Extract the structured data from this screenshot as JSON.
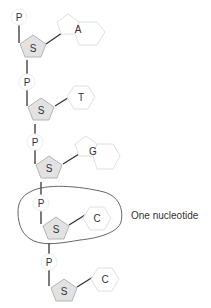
{
  "diagram": {
    "phosphate_label": "P",
    "sugar_label": "S",
    "nucleotides": [
      {
        "phosphate": "P",
        "sugar": "S",
        "base": "A",
        "base_type": "purine"
      },
      {
        "phosphate": "P",
        "sugar": "S",
        "base": "T",
        "base_type": "pyrimidine"
      },
      {
        "phosphate": "P",
        "sugar": "S",
        "base": "G",
        "base_type": "purine"
      },
      {
        "phosphate": "P",
        "sugar": "S",
        "base": "C",
        "base_type": "pyrimidine"
      },
      {
        "phosphate": "P",
        "sugar": "S",
        "base": "C",
        "base_type": "pyrimidine"
      }
    ],
    "annotation": "One nucleotide",
    "colors": {
      "sugar_fill": "#e2e2e2",
      "sugar_stroke": "#b5b5b5",
      "base_stroke": "#e0e0e0",
      "line": "#333333",
      "text": "#333333"
    }
  }
}
